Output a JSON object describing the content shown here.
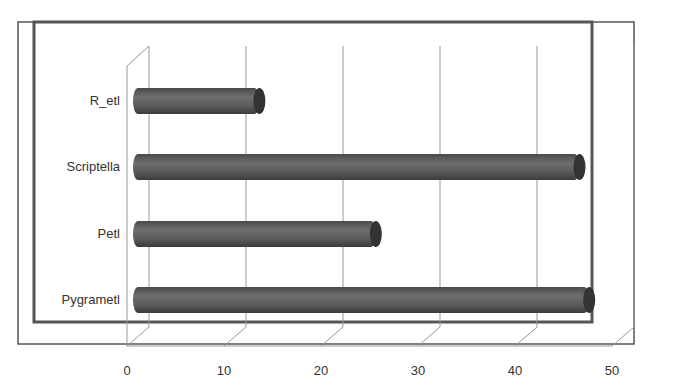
{
  "chart_data": {
    "type": "bar",
    "orientation": "horizontal",
    "style": "3d-cylinder",
    "title": "",
    "xlabel": "",
    "ylabel": "",
    "categories": [
      "R_etl",
      "Scriptella",
      "Petl",
      "Pygrametl"
    ],
    "values": [
      12,
      45,
      24,
      46
    ],
    "xlim": [
      0,
      50
    ],
    "xticks": [
      "0",
      "10",
      "20",
      "30",
      "40",
      "50"
    ],
    "grid": true,
    "legend": null,
    "bar_color": "#5a5a5a"
  }
}
